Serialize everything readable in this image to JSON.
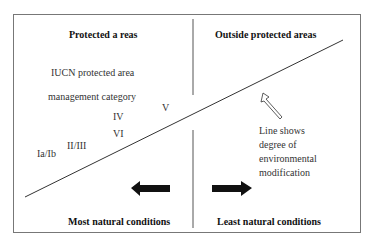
{
  "headings": {
    "left_top": "Protected a reas",
    "right_top": "Outside protected  areas",
    "left_bottom": "Most natural conditions",
    "right_bottom": "Least natural  conditions"
  },
  "category_label": [
    "IUCN protected area",
    "management category"
  ],
  "categories": [
    "Ia/Ib",
    "II/III",
    "IV",
    "V",
    "VI"
  ],
  "line_note": [
    "Line shows",
    "degree of",
    "environmental",
    "modification"
  ],
  "arrows": {
    "left": "arrow-left (toward most natural)",
    "right": "arrow-right (toward least natural)",
    "note": "hollow arrow pointing to line"
  },
  "colors": {
    "border": "#777777",
    "line": "#333333",
    "arrow": "#111111"
  }
}
